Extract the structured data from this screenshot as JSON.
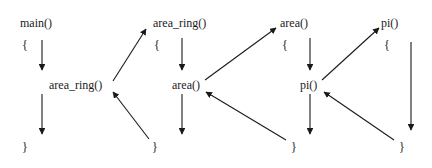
{
  "columns": [
    {
      "title": "main()",
      "open": "{",
      "call": "area_ring()",
      "close": "}"
    },
    {
      "title": "area_ring()",
      "open": "{",
      "call": "area()",
      "close": "}"
    },
    {
      "title": "area()",
      "open": "{",
      "call": "pi()",
      "close": "}"
    },
    {
      "title": "pi()",
      "open": "{",
      "close": "}"
    }
  ],
  "colors": {
    "line": "#1a1a1a",
    "background": "#ffffff"
  }
}
